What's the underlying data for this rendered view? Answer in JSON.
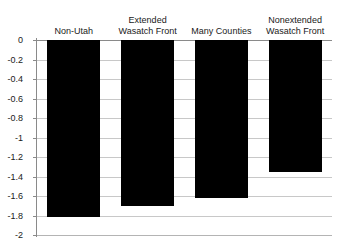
{
  "chart_data": {
    "type": "bar",
    "title": "",
    "subtitle": "",
    "xlabel": "",
    "ylabel": "",
    "categories": [
      "Non-Utah",
      "Extended\nWasatch Front",
      "Many Counties",
      "Nonextended\nWasatch Front"
    ],
    "values": [
      -1.82,
      -1.7,
      -1.62,
      -1.35
    ],
    "ylim": [
      -2,
      0
    ],
    "ytick_values": [
      0,
      -0.2,
      -0.4,
      -0.6,
      -0.8,
      -1,
      -1.2,
      -1.4,
      -1.6,
      -1.8,
      -2
    ],
    "ytick_labels": [
      "0",
      "-0.2",
      "-0.4",
      "-0.6",
      "-0.8",
      "-1",
      "-1.2",
      "-1.4",
      "-1.6",
      "-1.8",
      "-2"
    ],
    "grid": true,
    "legend": false,
    "legend_position": "none",
    "bar_color": "#000000",
    "gridline_color": "#c8c8c8",
    "axis_color": "#8a8a8a",
    "background_color": "#ffffff",
    "category_label_position": "above-zero-line",
    "orientation": "vertical"
  }
}
